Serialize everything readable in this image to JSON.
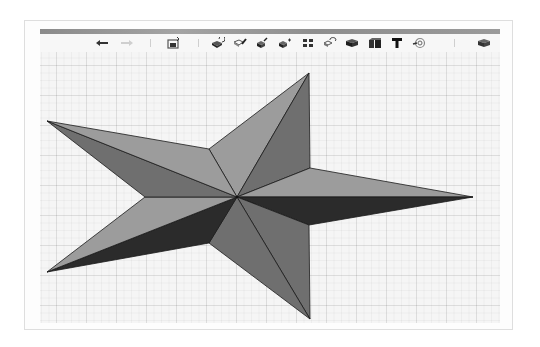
{
  "window": {
    "title_bar_color": "#999999"
  },
  "toolbar": {
    "items": [
      {
        "name": "undo",
        "icon": "undo-arrow-icon",
        "glyph": "←",
        "enabled": true
      },
      {
        "name": "redo",
        "icon": "redo-arrow-icon",
        "glyph": "→",
        "enabled": false
      },
      {
        "name": "insert-shape",
        "icon": "insert-shape-icon",
        "enabled": true
      },
      {
        "name": "tool-1",
        "icon": "cube-rotate-icon",
        "enabled": true
      },
      {
        "name": "tool-2",
        "icon": "cube-pencil-icon",
        "enabled": true
      },
      {
        "name": "tool-3",
        "icon": "cube-edit-icon",
        "enabled": true
      },
      {
        "name": "tool-4",
        "icon": "cube-add-icon",
        "enabled": true
      },
      {
        "name": "tool-5",
        "icon": "grid-squares-icon",
        "enabled": true
      },
      {
        "name": "tool-6",
        "icon": "cube-orbit-icon",
        "enabled": true
      },
      {
        "name": "tool-7",
        "icon": "cube-solid-icon",
        "enabled": true
      },
      {
        "name": "tool-8",
        "icon": "cube-box-icon",
        "enabled": true
      },
      {
        "name": "text",
        "icon": "text-t-icon",
        "glyph": "T",
        "enabled": true
      },
      {
        "name": "tool-10",
        "icon": "paint-swirl-icon",
        "enabled": true
      },
      {
        "name": "tool-11",
        "icon": "cube-export-icon",
        "enabled": true
      }
    ]
  },
  "canvas": {
    "background": "#f5f5f5",
    "grid": {
      "major_spacing_px": 30,
      "minor_spacing_px": 7.5
    }
  },
  "star": {
    "center": [
      237,
      197
    ],
    "colors": {
      "light": "#9c9c9c",
      "medium": "#6f6f6f",
      "dark": "#2b2b2b",
      "edge": "#1a1a1a"
    },
    "tips": {
      "top": [
        309,
        73
      ],
      "right": [
        473,
        197
      ],
      "bottom": [
        310,
        319
      ],
      "bottom_left": [
        47,
        272
      ],
      "left": [
        47,
        121
      ]
    },
    "inner": {
      "upper_left": [
        209,
        149
      ],
      "upper_right": [
        310,
        168
      ],
      "lower_right": [
        309,
        225
      ],
      "lower_left": [
        209,
        243
      ],
      "left": [
        145,
        197
      ]
    }
  }
}
